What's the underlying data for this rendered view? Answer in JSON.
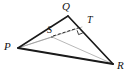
{
  "figure": {
    "kind": "geometry-diagram",
    "shape": "triangle",
    "canvas": {
      "width": 131,
      "height": 79,
      "background": "#ffffff"
    },
    "colors": {
      "outline": "#1a1a1a",
      "cevian": "#9a9a9a",
      "dashed": "#2b2b2b",
      "label": "#111111",
      "background": "#ffffff"
    },
    "vertices": [
      {
        "id": "P",
        "label": "P",
        "x": 18,
        "y": 48,
        "label_x": 4,
        "label_y": 43
      },
      {
        "id": "Q",
        "label": "Q",
        "x": 68,
        "y": 16,
        "label_x": 62,
        "label_y": 1
      },
      {
        "id": "R",
        "label": "R",
        "x": 113,
        "y": 64,
        "label_x": 117,
        "label_y": 62
      }
    ],
    "points": [
      {
        "id": "S",
        "label": "S",
        "x": 52,
        "y": 37,
        "label_x": 47,
        "label_y": 25
      },
      {
        "id": "T",
        "label": "T",
        "x": 82,
        "y": 27,
        "label_x": 87,
        "label_y": 16
      }
    ],
    "outline_edges": [
      {
        "id": "PQ",
        "from": "P",
        "to": "Q"
      },
      {
        "id": "QR",
        "from": "Q",
        "to": "R"
      },
      {
        "id": "PR",
        "from": "P",
        "to": "R"
      }
    ],
    "cevians": [
      {
        "id": "P-to-T",
        "from": "P",
        "to": "T"
      },
      {
        "id": "Q-to-R-through-S",
        "from": "Q",
        "to": "R"
      },
      {
        "id": "P-to-R-upper",
        "from": "P",
        "to": "R"
      }
    ],
    "dashed_segments": [
      {
        "id": "ST",
        "from": "S",
        "to": "T"
      }
    ],
    "right_angle_marks": [
      {
        "id": "angle-at-T",
        "at": "T",
        "size": 5
      }
    ],
    "stroke_widths": {
      "outline": 1.6,
      "cevian": 0.7,
      "dashed": 1.0,
      "dash_pattern": "3 2"
    }
  }
}
